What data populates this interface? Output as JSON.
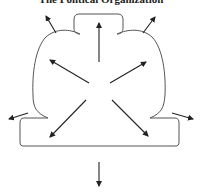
{
  "diagram": {
    "title": "The Political Organization",
    "shape": "organization-outline",
    "arrows": [
      {
        "name": "arrow-up",
        "direction": "up"
      },
      {
        "name": "arrow-upper-left-outer",
        "direction": "up-left"
      },
      {
        "name": "arrow-upper-right-outer",
        "direction": "up-right"
      },
      {
        "name": "arrow-inner-upper-left",
        "direction": "up-left"
      },
      {
        "name": "arrow-inner-upper-right",
        "direction": "up-right"
      },
      {
        "name": "arrow-inner-lower-left",
        "direction": "down-left"
      },
      {
        "name": "arrow-inner-lower-right",
        "direction": "down-right"
      },
      {
        "name": "arrow-left",
        "direction": "left"
      },
      {
        "name": "arrow-right",
        "direction": "right"
      },
      {
        "name": "arrow-down",
        "direction": "down"
      }
    ],
    "colors": {
      "line": "#555555",
      "arrow": "#222222",
      "background": "#ffffff"
    }
  }
}
